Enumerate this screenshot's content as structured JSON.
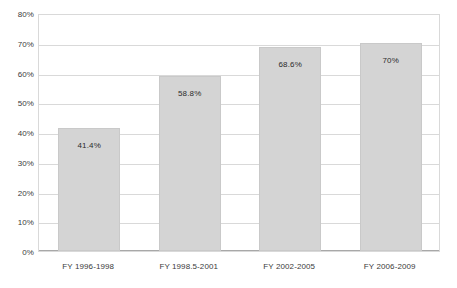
{
  "chart_data": {
    "type": "bar",
    "title": "",
    "subtitle": "",
    "xlabel": "",
    "ylabel": "",
    "categories": [
      "FY 1996-1998",
      "FY 1998.5-2001",
      "FY 2002-2005",
      "FY 2006-2009"
    ],
    "values": [
      41.4,
      58.8,
      68.6,
      70
    ],
    "data_labels": [
      "41.4%",
      "58.8%",
      "68.6%",
      "70%"
    ],
    "ylim": [
      0,
      80
    ],
    "ytick_values": [
      0,
      10,
      20,
      30,
      40,
      50,
      60,
      70,
      80
    ],
    "ytick_labels": [
      "0%",
      "10%",
      "20%",
      "30%",
      "40%",
      "50%",
      "60%",
      "70%",
      "80%"
    ],
    "grid": true,
    "legend": null,
    "legend_position": "none",
    "annotations": [],
    "colors": {
      "bar_fill": "#d4d4d4",
      "bar_border": "#c9c9c9",
      "gridline": "#d9d9d9",
      "axis_line": "#a8a8a8",
      "plot_border": "#d9d9d9",
      "label_text": "#2b2b2b",
      "tick_text": "#3b3b3b",
      "background": "#ffffff"
    }
  }
}
